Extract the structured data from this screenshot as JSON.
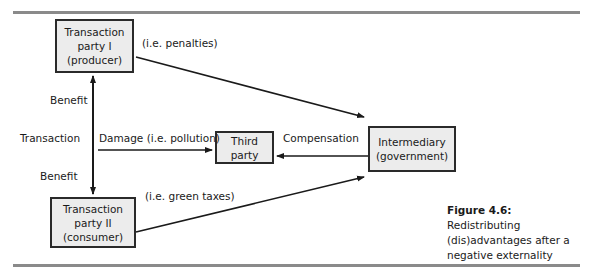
{
  "figure": {
    "nodes": {
      "party1": {
        "line1": "Transaction",
        "line2": "party I",
        "line3": "(producer)"
      },
      "party2": {
        "line1": "Transaction",
        "line2": "party II",
        "line3": "(consumer)"
      },
      "third": {
        "line1": "Third",
        "line2": "party"
      },
      "intermediary": {
        "line1": "Intermediary",
        "line2": "(government)"
      }
    },
    "labels": {
      "penalties": "(i.e. penalties)",
      "benefit_top": "Benefit",
      "transaction": "Transaction",
      "benefit_bottom": "Benefit",
      "damage": "Damage (i.e. pollution)",
      "compensation": "Compensation",
      "green_taxes": "(i.e. green taxes)"
    },
    "caption": {
      "number": "Figure 4.6:",
      "text": " Redistributing (dis)advantages after a negative externality"
    }
  }
}
